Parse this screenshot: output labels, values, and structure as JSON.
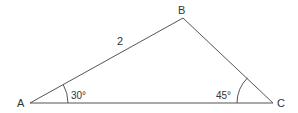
{
  "diagram": {
    "type": "triangle",
    "vertices": [
      {
        "id": "A",
        "label": "A",
        "x": 30,
        "y": 103
      },
      {
        "id": "B",
        "label": "B",
        "x": 183,
        "y": 18
      },
      {
        "id": "C",
        "label": "C",
        "x": 273,
        "y": 103
      }
    ],
    "side_labels": [
      {
        "side": "AB",
        "label": "2"
      }
    ],
    "angles": [
      {
        "vertex": "A",
        "label": "30°",
        "degrees": 30
      },
      {
        "vertex": "C",
        "label": "45°",
        "degrees": 45
      }
    ],
    "colors": {
      "stroke": "#444444",
      "text": "#333333",
      "background": "#ffffff"
    }
  }
}
